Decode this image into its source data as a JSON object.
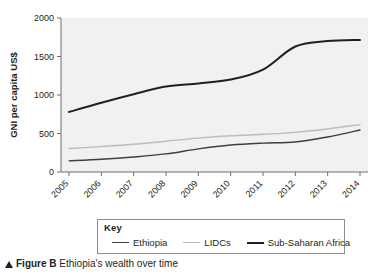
{
  "figure": {
    "caption_label": "Figure B",
    "caption_text": " Ethiopia's wealth over time",
    "marker_icon": "up-triangle-icon"
  },
  "legend": {
    "title": "Key",
    "items": [
      {
        "label": "Ethiopia",
        "color": "#3f3f3f",
        "width": 1.4
      },
      {
        "label": "LIDCs",
        "color": "#bcbcbc",
        "width": 1.4
      },
      {
        "label": "Sub-Saharan Africa",
        "color": "#231f20",
        "width": 2.0
      }
    ]
  },
  "chart_data": {
    "type": "line",
    "title": "",
    "xlabel": "",
    "ylabel": "GNI per capita US$",
    "categories": [
      "2005",
      "2006",
      "2007",
      "2008",
      "2009",
      "2010",
      "2011",
      "2012",
      "2013",
      "2014"
    ],
    "x": [
      2005,
      2006,
      2007,
      2008,
      2009,
      2010,
      2011,
      2012,
      2013,
      2014
    ],
    "ylim": [
      0,
      2000
    ],
    "yticks": [
      0,
      500,
      1000,
      1500,
      2000
    ],
    "ytick_labels": [
      "0",
      "500",
      "1000",
      "1500",
      "2000"
    ],
    "grid": false,
    "legend_position": "below-plot",
    "plot_background": "#f1f1f1",
    "series": [
      {
        "name": "Ethiopia",
        "color": "#3f3f3f",
        "width": 1.4,
        "values": [
          145,
          165,
          195,
          235,
          300,
          350,
          375,
          390,
          455,
          545
        ]
      },
      {
        "name": "LIDCs",
        "color": "#bcbcbc",
        "width": 1.4,
        "values": [
          305,
          330,
          360,
          400,
          440,
          470,
          490,
          515,
          560,
          615
        ]
      },
      {
        "name": "Sub-Saharan Africa",
        "color": "#231f20",
        "width": 2.0,
        "values": [
          780,
          900,
          1010,
          1110,
          1150,
          1200,
          1330,
          1630,
          1700,
          1715
        ]
      }
    ]
  }
}
